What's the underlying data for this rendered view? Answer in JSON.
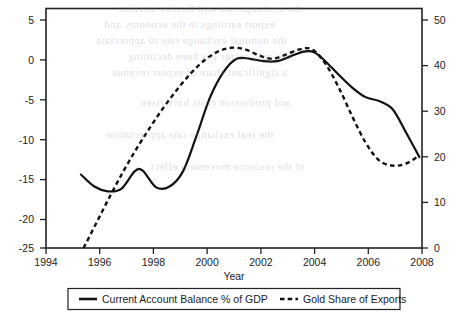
{
  "chart_data": {
    "type": "line",
    "title": "",
    "xlabel": "Year",
    "ylabel": "",
    "xlim": [
      1994,
      2008
    ],
    "xticks": [
      1994,
      1996,
      1998,
      2000,
      2002,
      2004,
      2006,
      2008
    ],
    "xtick_labels": [
      "1994",
      "1996",
      "1998",
      "2000",
      "2002",
      "2004",
      "2006",
      "2008"
    ],
    "left_axis": {
      "ylim": [
        -25,
        5
      ],
      "yticks": [
        5,
        0,
        -5,
        -10,
        -15,
        -20,
        -25
      ],
      "ytick_labels": [
        "5",
        "0",
        "-5",
        "-10",
        "-15",
        "-20",
        "-25"
      ]
    },
    "right_axis": {
      "ylim": [
        0,
        50
      ],
      "yticks": [
        50,
        40,
        30,
        20,
        10,
        0
      ],
      "ytick_labels": [
        "50",
        "40",
        "30",
        "20",
        "10",
        "0"
      ]
    },
    "grid": false,
    "legend_position": "bottom",
    "series": [
      {
        "name": "Current Account Balance % of GDP",
        "axis": "left",
        "style": "solid",
        "x": [
          1995.3,
          1995.8,
          1996.3,
          1996.8,
          1997.3,
          1997.6,
          1998.1,
          1998.6,
          1999.1,
          1999.6,
          2000.1,
          2000.6,
          2001.1,
          2001.6,
          2002.1,
          2002.6,
          2003.1,
          2003.6,
          2004.0,
          2004.4,
          2004.9,
          2005.4,
          2005.9,
          2006.4,
          2006.9,
          2007.4,
          2007.9
        ],
        "values": [
          -15.8,
          -17.3,
          -17.9,
          -17.6,
          -15.4,
          -15.3,
          -17.4,
          -17.3,
          -15.4,
          -11.0,
          -6.2,
          -3.0,
          -1.3,
          -1.3,
          -1.6,
          -1.6,
          -1.0,
          -0.4,
          -0.5,
          -1.6,
          -3.3,
          -4.9,
          -6.1,
          -6.6,
          -7.6,
          -10.5,
          -13.6
        ]
      },
      {
        "name": "Gold Share of Exports",
        "axis": "right",
        "style": "dashed",
        "x": [
          1995.4,
          1995.9,
          1996.4,
          1996.9,
          1997.4,
          1997.9,
          1998.4,
          1998.9,
          1999.4,
          1999.9,
          2000.4,
          2000.9,
          2001.4,
          2001.9,
          2002.4,
          2002.9,
          2003.4,
          2003.9,
          2004.4,
          2004.9,
          2005.4,
          2005.9,
          2006.4,
          2006.9,
          2007.4,
          2007.9
        ],
        "values": [
          0.0,
          5.5,
          11.0,
          16.2,
          21.0,
          25.4,
          29.5,
          33.2,
          36.5,
          39.2,
          41.0,
          41.8,
          41.5,
          40.3,
          39.5,
          40.3,
          41.4,
          41.5,
          38.5,
          33.5,
          27.5,
          22.0,
          18.3,
          17.2,
          17.6,
          19.3
        ]
      }
    ]
  },
  "legend": {
    "entries": [
      {
        "label": "Current Account Balance % of GDP",
        "style": "solid"
      },
      {
        "label": "Gold Share of Exports",
        "style": "dashed"
      }
    ]
  },
  "bleed_text": {
    "lines": [
      "the exchange rate and thereby sterilise",
      "export earnings in the economy and",
      "the nominal exchange rate to appreciate",
      "the gold sector has been declining",
      "a significant share of export revenue",
      "and production costs have risen",
      "the real exchange rate appreciation",
      "of the resource movement effect"
    ]
  }
}
